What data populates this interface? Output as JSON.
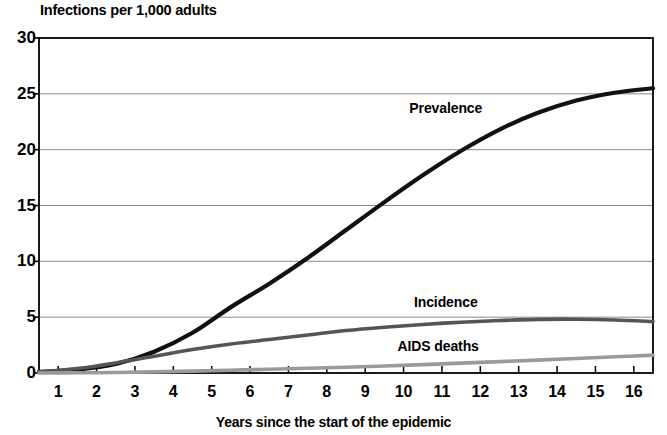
{
  "chart_data": {
    "type": "line",
    "title": "Infections per 1,000 adults",
    "xlabel": "Years since the start of the epidemic",
    "ylabel": "Infections per 1,000 adults",
    "xlim": [
      0,
      16
    ],
    "ylim": [
      0,
      30
    ],
    "grid": true,
    "grid_axis": "y",
    "legend_position": "inline-annotations",
    "y_ticks": [
      "0",
      "5",
      "10",
      "15",
      "20",
      "25",
      "30"
    ],
    "y_tick_values": [
      0,
      5,
      10,
      15,
      20,
      25,
      30
    ],
    "x_ticks": [
      "1",
      "2",
      "3",
      "4",
      "5",
      "6",
      "7",
      "8",
      "9",
      "10",
      "11",
      "12",
      "13",
      "14",
      "15",
      "16"
    ],
    "x_tick_values": [
      1,
      2,
      3,
      4,
      5,
      6,
      7,
      8,
      9,
      10,
      11,
      12,
      13,
      14,
      15,
      16
    ],
    "x": [
      0,
      1,
      2,
      3,
      4,
      5,
      6,
      7,
      8,
      9,
      10,
      11,
      12,
      13,
      14,
      15,
      16
    ],
    "series": [
      {
        "name": "Prevalence",
        "color": "#111111",
        "width": 4.2,
        "label_x": 10.6,
        "label_y": 23.6,
        "values": [
          0.1,
          0.3,
          0.8,
          1.9,
          3.6,
          5.9,
          8.0,
          10.3,
          12.8,
          15.3,
          17.7,
          19.9,
          21.8,
          23.3,
          24.4,
          25.1,
          25.5
        ]
      },
      {
        "name": "Incidence",
        "color": "#555555",
        "width": 3.6,
        "label_x": 10.6,
        "label_y": 6.3,
        "values": [
          0.1,
          0.4,
          0.9,
          1.5,
          2.1,
          2.6,
          3.0,
          3.4,
          3.8,
          4.1,
          4.35,
          4.55,
          4.7,
          4.8,
          4.82,
          4.75,
          4.6
        ]
      },
      {
        "name": "AIDS deaths",
        "color": "#9a9a9a",
        "width": 3.6,
        "label_x": 10.4,
        "label_y": 2.35,
        "values": [
          0.0,
          0.02,
          0.05,
          0.1,
          0.17,
          0.25,
          0.33,
          0.42,
          0.52,
          0.63,
          0.75,
          0.88,
          1.02,
          1.15,
          1.3,
          1.45,
          1.6
        ]
      }
    ],
    "axis_color": "#000000",
    "gridline_color": "#8a8a8a",
    "background": "#ffffff"
  },
  "plot_geometry": {
    "left": 39,
    "right": 653,
    "top": 38,
    "bottom": 373
  }
}
